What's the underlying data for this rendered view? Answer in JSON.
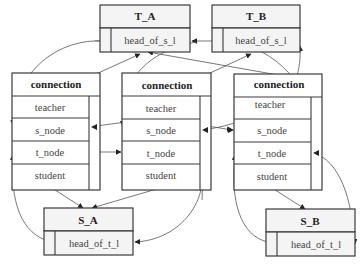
{
  "diagram": {
    "type": "linked-structure",
    "nodes": {
      "t_a": {
        "title": "T_A",
        "field": "head_of_s_l"
      },
      "t_b": {
        "title": "T_B",
        "field": "head_of_s_l"
      },
      "s_a": {
        "title": "S_A",
        "field": "head_of_t_l"
      },
      "s_b": {
        "title": "S_B",
        "field": "head_of_t_l"
      },
      "connections": [
        {
          "title": "connection",
          "fields": [
            "teacher",
            "s_node",
            "t_node",
            "student"
          ]
        },
        {
          "title": "connection",
          "fields": [
            "teacher",
            "s_node",
            "t_node",
            "student"
          ]
        },
        {
          "title": "connection",
          "fields": [
            "teacher",
            "s_node",
            "t_node",
            "student"
          ]
        }
      ]
    },
    "edges": [
      {
        "from": "connection1.teacher",
        "to": "T_A"
      },
      {
        "from": "connection2.teacher",
        "to": "T_B"
      },
      {
        "from": "connection3.teacher",
        "to": "T_A"
      },
      {
        "from": "connection1.student",
        "to": "S_A"
      },
      {
        "from": "connection2.student",
        "to": "S_A"
      },
      {
        "from": "connection3.student",
        "to": "S_B"
      },
      {
        "from": "T_A.head_of_s_l",
        "to": "connection1.s_node"
      },
      {
        "from": "T_A.head_of_s_l",
        "to": "T_B.head_of_s_l"
      },
      {
        "from": "T_B.head_of_s_l",
        "to": "connection3.s_node"
      },
      {
        "from": "connection1.t_node",
        "to": "connection2.t_node"
      },
      {
        "from": "S_A.head_of_t_l",
        "to": "connection1.t_node"
      },
      {
        "from": "connection2.t_node",
        "to": "S_A.head_of_t_l"
      },
      {
        "from": "S_B.head_of_t_l",
        "to": "connection3.t_node"
      }
    ]
  }
}
